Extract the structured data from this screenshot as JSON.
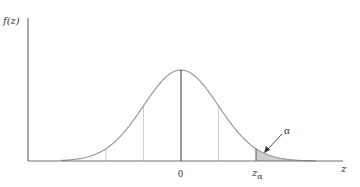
{
  "chart_data": {
    "type": "area",
    "title": "",
    "ylabel": "f(z)",
    "xlabel": "z",
    "x_ticks": [
      {
        "label": "0",
        "z": 0
      },
      {
        "label": "zα",
        "z": 2.0
      }
    ],
    "dotted_guides_at_z": [
      -2,
      -1,
      1
    ],
    "series": [
      {
        "name": "f(z)",
        "function": "standard normal pdf",
        "xlim": [
          -3.2,
          3.6
        ]
      }
    ],
    "shaded_region": {
      "from_z": 2.0,
      "to_z": 3.6,
      "label": "α"
    },
    "grid": false,
    "legend": null
  },
  "labels": {
    "y_axis": "f(z)",
    "x_axis": "z",
    "zero": "0",
    "z_alpha_base": "z",
    "z_alpha_sub": "α",
    "alpha": "α"
  },
  "colors": {
    "curve": "#9a9a9a",
    "axis": "#707070",
    "center_line": "#404040",
    "shade": "#cfcfcf",
    "guide": "#c8c8c8"
  }
}
